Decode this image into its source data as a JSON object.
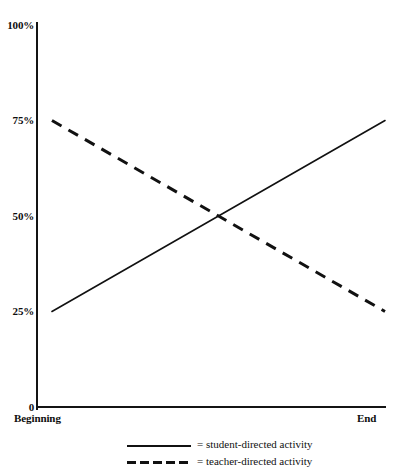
{
  "chart_data": {
    "type": "line",
    "title": "",
    "xlabel": "",
    "ylabel": "",
    "grid": false,
    "legend_position": "bottom",
    "x": [
      "Beginning",
      "End"
    ],
    "xlim": [
      0,
      1
    ],
    "ylim": [
      0,
      100
    ],
    "yticks": [
      "0",
      "25%",
      "50%",
      "75%",
      "100%"
    ],
    "ytick_values": [
      0,
      25,
      50,
      75,
      100
    ],
    "xtick_labels": {
      "begin": "Beginning",
      "end": "End"
    },
    "series": [
      {
        "name": "student-directed activity",
        "style": "solid",
        "color": "#111111",
        "values": [
          25,
          75
        ]
      },
      {
        "name": "teacher-directed activity",
        "style": "dashed",
        "color": "#111111",
        "values": [
          75,
          25
        ]
      }
    ],
    "crossing_point": {
      "x": 0.5,
      "y": 50
    }
  },
  "axis": {
    "yticks": [
      {
        "label": "100%",
        "value": 100
      },
      {
        "label": "75%",
        "value": 75
      },
      {
        "label": "50%",
        "value": 50
      },
      {
        "label": "25%",
        "value": 25
      },
      {
        "label": "0",
        "value": 0
      }
    ],
    "x_begin_label": "Beginning",
    "x_end_label": "End"
  },
  "legend": {
    "entries": [
      {
        "marker": "solid-line-sample",
        "text": "= student-directed activity"
      },
      {
        "marker": "dashed-line-sample",
        "text": "= teacher-directed activity"
      }
    ]
  },
  "colors": {
    "ink": "#111111",
    "background": "#ffffff"
  }
}
